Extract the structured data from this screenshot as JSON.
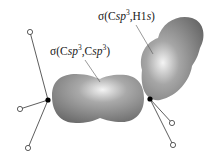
{
  "diagram": {
    "title": "",
    "labels": {
      "cc_bond": {
        "sigma": "σ(",
        "c1": "C",
        "sp1": "sp",
        "exp1": "3",
        "sep": ",",
        "c2": "C",
        "sp2": "sp",
        "exp2": "3",
        "close": ")",
        "full_text": "σ(Csp3,Csp3)"
      },
      "ch_bond": {
        "sigma": "σ(",
        "c1": "C",
        "sp1": "sp",
        "exp1": "3",
        "sep": ",H1",
        "s": "s",
        "close": ")",
        "full_text": "σ(Csp3,H1s)"
      }
    },
    "atoms": {
      "carbons": [
        {
          "name": "left-carbon",
          "x": 48,
          "y": 100
        },
        {
          "name": "right-carbon",
          "x": 150,
          "y": 99
        }
      ],
      "hydrogens": [
        {
          "name": "left-top-hydrogen",
          "x": 30,
          "y": 32
        },
        {
          "name": "left-middle-hydrogen",
          "x": 20,
          "y": 109
        },
        {
          "name": "left-bottom-hydrogen",
          "x": 28,
          "y": 148
        },
        {
          "name": "right-upper-hydrogen",
          "x": 172,
          "y": 123
        },
        {
          "name": "right-lower-hydrogen",
          "x": 173,
          "y": 145
        }
      ]
    },
    "orbitals": [
      {
        "name": "c-c-sigma-orbital",
        "description": "σ(Csp3,Csp3) bonding orbital"
      },
      {
        "name": "c-h-sigma-orbital",
        "description": "σ(Csp3,H1s) bonding orbital"
      }
    ],
    "colors": {
      "orbital_dark": "#6e6e6e",
      "orbital_mid": "#9a9a9a",
      "orbital_highlight": "#f2f2f2",
      "bond_line": "#333333",
      "atom_fill_carbon": "#000000",
      "atom_fill_hydrogen": "#ffffff"
    }
  }
}
